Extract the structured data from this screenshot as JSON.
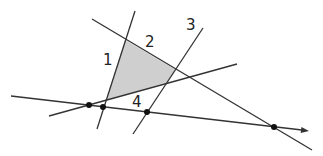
{
  "diagram": {
    "type": "line-arrangement",
    "colors": {
      "line": "#333333",
      "region_fill": "#cfcfcf",
      "point": "#111111",
      "background": "#ffffff"
    },
    "lines": [
      {
        "id": "line-1",
        "label": "1",
        "x1": 135,
        "y1": 11,
        "x2": 97,
        "y2": 129,
        "label_x": 103,
        "label_y": 65
      },
      {
        "id": "line-2",
        "label": "2",
        "x1": 92,
        "y1": 19,
        "x2": 312,
        "y2": 150,
        "label_x": 145,
        "label_y": 47
      },
      {
        "id": "line-3",
        "label": "3",
        "x1": 203,
        "y1": 28,
        "x2": 133,
        "y2": 134,
        "label_x": 186,
        "label_y": 30
      },
      {
        "id": "line-4",
        "label": "4",
        "x1": 49,
        "y1": 116,
        "x2": 237,
        "y2": 64,
        "label_x": 132,
        "label_y": 107
      }
    ],
    "directed_line": {
      "id": "horizontal-directed-line",
      "x1": 11,
      "y1": 96,
      "x2": 302,
      "y2": 130,
      "arrow_tip_x": 309,
      "arrow_tip_y": 131
    },
    "shaded_region": {
      "points": "125,40 176,70 168,82 106,100"
    },
    "points": [
      {
        "x": 89,
        "y": 105
      },
      {
        "x": 103,
        "y": 107
      },
      {
        "x": 147,
        "y": 112
      },
      {
        "x": 274,
        "y": 127
      }
    ]
  }
}
